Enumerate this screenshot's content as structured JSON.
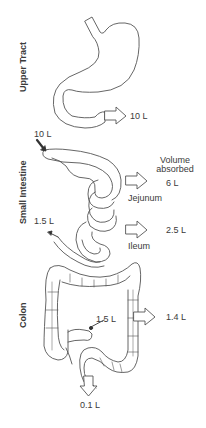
{
  "sections": {
    "upper_tract": "Upper Tract",
    "small_intestine": "Small Intestine",
    "colon": "Colon"
  },
  "header": {
    "volume_absorbed_line1": "Volume",
    "volume_absorbed_line2": "absorbed"
  },
  "upper_tract": {
    "output_volume": "10 L"
  },
  "small_intestine": {
    "input_volume": "10 L",
    "jejunum_label": "Jejunum",
    "jejunum_absorbed": "6 L",
    "ileum_label": "Ileum",
    "ileum_absorbed": "2.5 L",
    "output_volume": "1.5 L"
  },
  "colon": {
    "input_volume": "1.5 L",
    "absorbed": "1.4 L",
    "excreted": "0.1 L"
  },
  "colors": {
    "stroke": "#555555",
    "text": "#3a3a3a",
    "background": "#ffffff"
  }
}
